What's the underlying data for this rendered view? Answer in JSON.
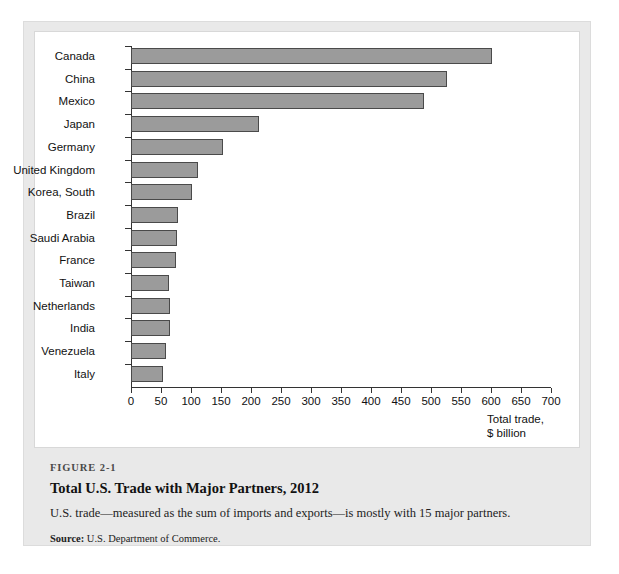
{
  "figure": {
    "number": "FIGURE 2-1",
    "title": "Total U.S. Trade with Major Partners, 2012",
    "description": "U.S. trade—measured as the sum of imports and exports—is mostly with 15 major partners.",
    "source_label": "Source:",
    "source_text": "U.S. Department of Commerce."
  },
  "chart_data": {
    "type": "bar",
    "orientation": "horizontal",
    "title": "Total U.S. Trade with Major Partners, 2012",
    "xlabel": "Total trade, $ billion",
    "ylabel": "",
    "xlim": [
      0,
      700
    ],
    "grid": false,
    "legend": null,
    "bar_color": "#9b9b9b",
    "bar_border_color": "#4a4a4a",
    "categories": [
      "Canada",
      "China",
      "Mexico",
      "Japan",
      "Germany",
      "United Kingdom",
      "Korea, South",
      "Brazil",
      "Saudi Arabia",
      "France",
      "Taiwan",
      "Netherlands",
      "India",
      "Venezuela",
      "Italy"
    ],
    "values": [
      602,
      526,
      488,
      213,
      154,
      112,
      101,
      78,
      76,
      75,
      64,
      65,
      65,
      58,
      53
    ],
    "xticks": [
      0,
      50,
      100,
      150,
      200,
      250,
      300,
      350,
      400,
      450,
      500,
      550,
      600,
      650,
      700
    ],
    "xtick_labels": [
      "0",
      "50",
      "100",
      "150",
      "200",
      "250",
      "300",
      "350",
      "400",
      "450",
      "500",
      "550",
      "600",
      "650",
      "700"
    ],
    "axis_title_lines": [
      "Total trade,",
      "$ billion"
    ]
  }
}
